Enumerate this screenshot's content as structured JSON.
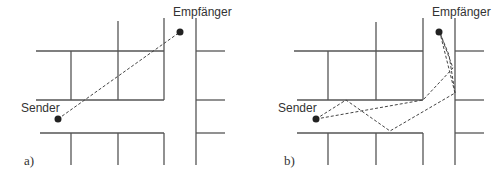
{
  "panels": [
    {
      "id": "a",
      "label": "a)",
      "sender_label": "Sender",
      "receiver_label": "Empfänger",
      "description": "Direct line-of-sight path"
    },
    {
      "id": "b",
      "label": "b)",
      "sender_label": "Sender",
      "receiver_label": "Empfänger",
      "description": "Multipath reflections"
    }
  ]
}
